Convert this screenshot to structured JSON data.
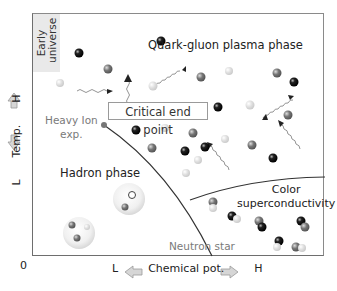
{
  "diagram": {
    "y_axis": {
      "low": "L",
      "label": "Temp.",
      "high": "H"
    },
    "x_axis": {
      "low": "L",
      "label": "Chemical pot.",
      "high": "H"
    },
    "origin": "0",
    "regions": {
      "early_universe": "Early universe",
      "qgp": "Quark-gluon plasma phase",
      "hadron": "Hadron phase",
      "color_sc_line1": "Color",
      "color_sc_line2": "superconductivity",
      "neutron_star": "Neutron star"
    },
    "annotations": {
      "critical_end_point": "Critical end point",
      "heavy_ion_line1": "Heavy Ion",
      "heavy_ion_line2": "exp."
    },
    "colors": {
      "frame": "#6e6e6e",
      "early_universe_fill": "#e9e9e9",
      "phase_line": "#333333",
      "neutron_star_text": "#7a7a7a",
      "arrow_fill": "#d0d0d0"
    }
  }
}
